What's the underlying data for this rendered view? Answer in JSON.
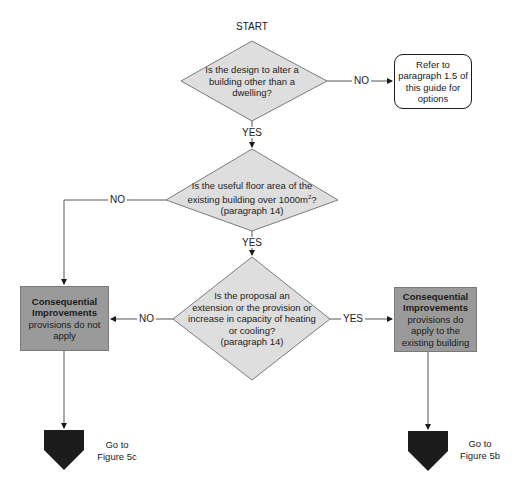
{
  "flowchart": {
    "start_label": "START",
    "decision_1": {
      "text": "Is the design to alter a building other than a dwelling?",
      "line1": "Is the design to alter a",
      "line2": "building other than a",
      "line3": "dwelling?",
      "no_label": "NO",
      "yes_label": "YES"
    },
    "refer_box": {
      "line1": "Refer to",
      "line2": "paragraph  1.5 of",
      "line3": "this guide for",
      "line4": "options"
    },
    "decision_2": {
      "line1": "Is the useful floor area of the",
      "line2": "existing building over 1000m",
      "superscript": "2",
      "line2_end": "?",
      "line3": "(paragraph 14)",
      "no_label": "NO",
      "yes_label": "YES"
    },
    "decision_3": {
      "line1": "Is the proposal an",
      "line2": "extension or the provision or",
      "line3": "increase in capacity of heating",
      "line4": "or cooling?",
      "line5": "(paragraph 14)",
      "no_label": "NO",
      "yes_label": "YES"
    },
    "outcome_no": {
      "title1": "Consequential",
      "title2": "Improvements",
      "line1": "provisions do not",
      "line2": "apply"
    },
    "outcome_yes": {
      "title1": "Consequential",
      "title2": "Improvements",
      "line1": "provisions do",
      "line2": "apply to the",
      "line3": "existing building"
    },
    "connector_left": {
      "line1": "Go to",
      "line2": "Figure 5c"
    },
    "connector_right": {
      "line1": "Go to",
      "line2": "Figure 5b"
    },
    "colors": {
      "decision_fill": "#dedede",
      "outcome_fill": "#9a9a9a",
      "connector_fill": "#1c1c1c",
      "line": "#555555"
    }
  }
}
